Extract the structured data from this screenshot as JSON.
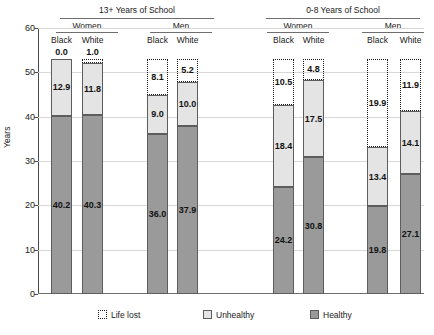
{
  "chart_data": {
    "type": "bar",
    "subtype": "stacked-bar",
    "title": "",
    "xlabel": "",
    "ylabel": "Years",
    "ylim": [
      0,
      60
    ],
    "yticks": [
      0,
      10,
      20,
      30,
      40,
      50,
      60
    ],
    "grid": true,
    "legend_position": "bottom",
    "group_headers": [
      "13+ Years of School",
      "0-8 Years of School"
    ],
    "sex_headers": [
      "Women",
      "Men",
      "Women",
      "Men"
    ],
    "categories": [
      "Black",
      "White",
      "Black",
      "White",
      "Black",
      "White",
      "Black",
      "White"
    ],
    "series": [
      {
        "name": "Healthy",
        "values": [
          40.2,
          40.3,
          36.0,
          37.9,
          24.2,
          30.8,
          19.8,
          27.1
        ]
      },
      {
        "name": "Unhealthy",
        "values": [
          12.9,
          11.8,
          9.0,
          10.0,
          18.4,
          17.5,
          13.4,
          14.1
        ]
      },
      {
        "name": "Life lost",
        "values": [
          0.0,
          1.0,
          8.1,
          5.2,
          10.5,
          4.8,
          19.9,
          11.9
        ]
      }
    ],
    "bars": [
      {
        "group": "13+ Years of School",
        "sex": "Women",
        "race": "Black",
        "healthy": 40.2,
        "unhealthy": 12.9,
        "lost": 0.0,
        "top_label": "0.0"
      },
      {
        "group": "13+ Years of School",
        "sex": "Women",
        "race": "White",
        "healthy": 40.3,
        "unhealthy": 11.8,
        "lost": 1.0,
        "top_label": "1.0"
      },
      {
        "group": "13+ Years of School",
        "sex": "Men",
        "race": "Black",
        "healthy": 36.0,
        "unhealthy": 9.0,
        "lost": 8.1,
        "top_label": ""
      },
      {
        "group": "13+ Years of School",
        "sex": "Men",
        "race": "White",
        "healthy": 37.9,
        "unhealthy": 10.0,
        "lost": 5.2,
        "top_label": ""
      },
      {
        "group": "0-8 Years of School",
        "sex": "Women",
        "race": "Black",
        "healthy": 24.2,
        "unhealthy": 18.4,
        "lost": 10.5,
        "top_label": ""
      },
      {
        "group": "0-8 Years of School",
        "sex": "Women",
        "race": "White",
        "healthy": 30.8,
        "unhealthy": 17.5,
        "lost": 4.8,
        "top_label": ""
      },
      {
        "group": "0-8 Years of School",
        "sex": "Men",
        "race": "Black",
        "healthy": 19.8,
        "unhealthy": 13.4,
        "lost": 19.9,
        "top_label": ""
      },
      {
        "group": "0-8 Years of School",
        "sex": "Men",
        "race": "White",
        "healthy": 27.1,
        "unhealthy": 14.1,
        "lost": 11.9,
        "top_label": ""
      }
    ],
    "legend": [
      {
        "label": "Life lost",
        "style": "dotted-outline",
        "color": "#ffffff"
      },
      {
        "label": "Unhealthy",
        "style": "filled",
        "color": "#e4e4e4"
      },
      {
        "label": "Healthy",
        "style": "filled",
        "color": "#9a9a9a"
      }
    ],
    "colors": {
      "healthy": "#9a9a9a",
      "unhealthy": "#e4e4e4",
      "life_lost_outline": "#1a1a1a",
      "gridline": "#d8d8d8",
      "axis": "#4a4a4a",
      "text": "#1a1a1a"
    }
  },
  "axis": {
    "y_label": "Years",
    "y_ticks": [
      "60",
      "50",
      "40",
      "30",
      "20",
      "10",
      "0"
    ]
  },
  "headers": {
    "group_left": "13+ Years of School",
    "group_right": "0-8 Years of School",
    "sex": [
      "Women",
      "Men",
      "Women",
      "Men"
    ],
    "race": [
      "Black",
      "White",
      "Black",
      "White",
      "Black",
      "White",
      "Black",
      "White"
    ]
  },
  "top_labels": [
    "0.0",
    "1.0"
  ],
  "bar_values": {
    "healthy": [
      "40.2",
      "40.3",
      "36.0",
      "37.9",
      "24.2",
      "30.8",
      "19.8",
      "27.1"
    ],
    "unhealthy": [
      "12.9",
      "11.8",
      "9.0",
      "10.0",
      "18.4",
      "17.5",
      "13.4",
      "14.1"
    ],
    "lost": [
      "",
      "",
      "8.1",
      "5.2",
      "10.5",
      "4.8",
      "19.9",
      "11.9"
    ]
  },
  "legend": {
    "life_lost": "Life lost",
    "unhealthy": "Unhealthy",
    "healthy": "Healthy"
  }
}
